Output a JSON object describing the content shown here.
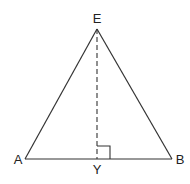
{
  "diagram": {
    "type": "isosceles triangle with altitude",
    "points": {
      "E": {
        "label": "E",
        "x": 97,
        "y": 29
      },
      "A": {
        "label": "A",
        "x": 25,
        "y": 159
      },
      "B": {
        "label": "B",
        "x": 172,
        "y": 159
      },
      "Y": {
        "label": "Y",
        "x": 97,
        "y": 159
      }
    },
    "segments": [
      {
        "from": "E",
        "to": "A",
        "style": "solid"
      },
      {
        "from": "E",
        "to": "B",
        "style": "solid"
      },
      {
        "from": "A",
        "to": "B",
        "style": "solid"
      },
      {
        "from": "E",
        "to": "Y",
        "style": "dashed"
      }
    ],
    "right_angle_at": "Y",
    "colors": {
      "line": "#333333",
      "background": "#ffffff"
    }
  }
}
